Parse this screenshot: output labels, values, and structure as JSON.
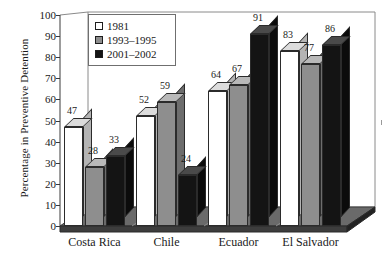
{
  "chart_data": {
    "type": "bar",
    "title": "",
    "subtitle": "",
    "xlabel": "",
    "ylabel": "Percentage in Preventive Detention",
    "ylim": [
      0,
      100
    ],
    "ytick_step": 10,
    "yticks": [
      100,
      90,
      80,
      70,
      60,
      50,
      40,
      30,
      20,
      10,
      0
    ],
    "grid": false,
    "three_d": true,
    "legend_position": "top-left inside plot",
    "categories": [
      "Costa Rica",
      "Chile",
      "Ecuador",
      "El Salvador"
    ],
    "series": [
      {
        "name": "1981",
        "color": "#ffffff",
        "values": [
          47,
          52,
          64,
          83
        ]
      },
      {
        "name": "1993–1995",
        "color": "#8e8e8e",
        "values": [
          28,
          59,
          67,
          77
        ]
      },
      {
        "name": "2001–2002",
        "color": "#141414",
        "values": [
          33,
          24,
          91,
          86
        ]
      }
    ],
    "data_labels": [
      [
        "47",
        "28",
        "33"
      ],
      [
        "52",
        "59",
        "24"
      ],
      [
        "64",
        "67",
        "91"
      ],
      [
        "83",
        "77",
        "86"
      ]
    ]
  },
  "axis": {
    "y_title": "Percentage in Preventive Detention"
  },
  "legend": {
    "entries": [
      {
        "label": "1981"
      },
      {
        "label": "1993–1995"
      },
      {
        "label": "2001–2002"
      }
    ]
  }
}
